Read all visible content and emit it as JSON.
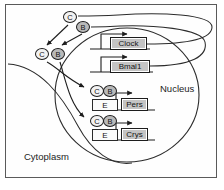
{
  "figure": {
    "compartments": [
      {
        "id": "nucleus",
        "label": "Nucleus"
      },
      {
        "id": "cytoplasm",
        "label": "Cytoplasm"
      }
    ]
  },
  "proteins": {
    "clock_label": "C",
    "bmal_label": "B"
  },
  "nodes": [
    {
      "id": "prot-c-top",
      "label": "C",
      "kind": "clock-protein"
    },
    {
      "id": "prot-b-top",
      "label": "B",
      "kind": "bmal-protein"
    },
    {
      "id": "prot-c-cyto",
      "label": "C",
      "kind": "clock-protein"
    },
    {
      "id": "prot-b-cyto",
      "label": "B",
      "kind": "bmal-protein"
    },
    {
      "id": "prot-c-pers",
      "label": "C",
      "kind": "clock-protein"
    },
    {
      "id": "prot-b-pers",
      "label": "B",
      "kind": "bmal-protein"
    },
    {
      "id": "prot-c-crys",
      "label": "C",
      "kind": "clock-protein"
    },
    {
      "id": "prot-b-crys",
      "label": "B",
      "kind": "bmal-protein"
    }
  ],
  "genes": [
    {
      "id": "clock",
      "label": "Clock"
    },
    {
      "id": "bmal1",
      "label": "Bmal1"
    },
    {
      "id": "pers",
      "label": "Pers"
    },
    {
      "id": "crys",
      "label": "Crys"
    }
  ],
  "promoters": [
    {
      "id": "ebox-pers",
      "label": "E"
    },
    {
      "id": "ebox-crys",
      "label": "E"
    }
  ],
  "colors": {
    "protein_c_fill": "#f2f2f2",
    "protein_b_fill": "#b9b9b9",
    "gene_box_fill": "#c4c4c4",
    "promoter_fill": "#fbfbfb",
    "stroke": "#1d1d1d",
    "frame": "#5a5a5a",
    "background": "#ffffff"
  }
}
